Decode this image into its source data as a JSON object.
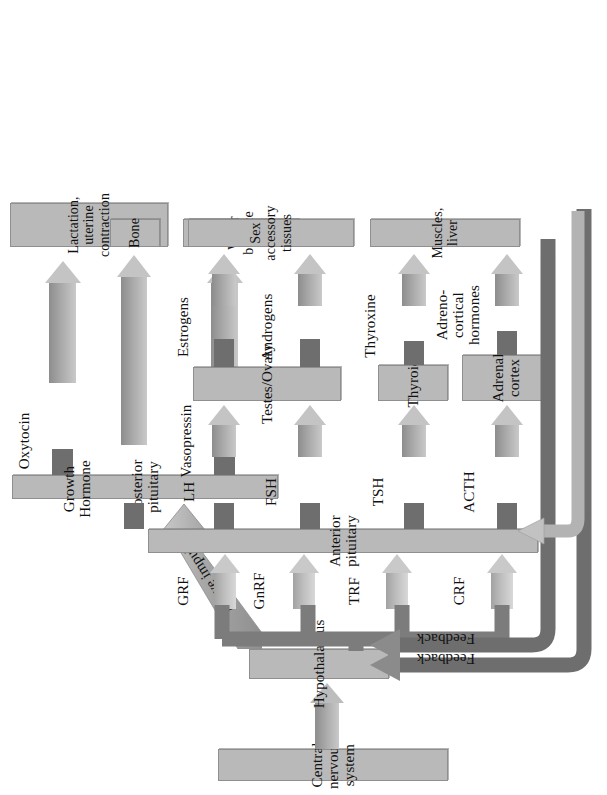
{
  "diagram": {
    "colors": {
      "box_fill": "#b9b9b9",
      "box_border": "#8f8f8f",
      "arrow_mid": "#a9a9a9",
      "arrow_dark": "#7a7a7a",
      "arrow_light": "#c6c6c6",
      "background": "#ffffff",
      "text": "#111111"
    }
  },
  "nodes": {
    "cns": "Central nervous system",
    "hypothalamus": "Hypothalamus",
    "anterior_pituitary": "Anterior pituitary",
    "posterior_pituitary": "Posterior pituitary",
    "adrenal_cortex": "Adrenal\ncortex",
    "thyroid": "Thyroid",
    "testes_ovary": "Testes/Ovary",
    "muscles_liver": "Muscles, liver",
    "sex_accessory": "Sex accessory tissues",
    "bone": "Bone",
    "water_balance": "Water balance",
    "lactation": "Lactation,\nuterine contraction"
  },
  "releasing_factors": [
    {
      "id": "crf",
      "label": "CRF"
    },
    {
      "id": "trf",
      "label": "TRF"
    },
    {
      "id": "gnrf",
      "label": "GnRF"
    },
    {
      "id": "grf",
      "label": "GRF"
    }
  ],
  "anterior_hormones": [
    {
      "id": "acth",
      "label": "ACTH",
      "target": "adrenal_cortex"
    },
    {
      "id": "tsh",
      "label": "TSH",
      "target": "thyroid"
    },
    {
      "id": "fsh",
      "label": "FSH",
      "target": "testes_ovary"
    },
    {
      "id": "lh",
      "label": "LH",
      "target": "testes_ovary"
    },
    {
      "id": "gh",
      "label": "Growth\nHormone",
      "target": "bone"
    }
  ],
  "posterior_hormones": [
    {
      "id": "vasopressin",
      "label": "Vasopressin",
      "target": "water_balance"
    },
    {
      "id": "oxytocin",
      "label": "Oxytocin",
      "target": "lactation"
    }
  ],
  "target_hormones": [
    {
      "id": "adrenocortical",
      "label": "Adreno-\ncortical\nhormones",
      "target": "muscles_liver"
    },
    {
      "id": "thyroxine",
      "label": "Thyroxine",
      "target": "muscles_liver"
    },
    {
      "id": "androgens",
      "label": "Androgens",
      "target": "sex_accessory"
    },
    {
      "id": "estrogens",
      "label": "Estrogens",
      "target": "sex_accessory"
    }
  ],
  "connections": {
    "nerve_impulses": "Nerve impulses",
    "feedback_outer": "Feedback",
    "feedback_inner": "Feedback"
  }
}
